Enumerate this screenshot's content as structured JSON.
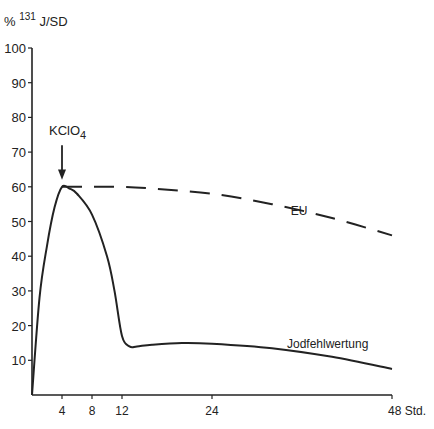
{
  "chart_data": {
    "type": "line",
    "title": "",
    "ylabel_prefix": "%",
    "ylabel_sup": "131",
    "ylabel_main": "J/SD",
    "xlabel": "Std.",
    "xlim": [
      0,
      48
    ],
    "ylim": [
      0,
      100
    ],
    "x_ticks": [
      4,
      8,
      12,
      24,
      48
    ],
    "x_tick_labels": [
      "4",
      "8",
      "12",
      "24",
      "48 Std."
    ],
    "y_ticks": [
      10,
      20,
      30,
      40,
      50,
      60,
      70,
      80,
      90,
      100
    ],
    "y_tick_labels": [
      "10",
      "20",
      "30",
      "40",
      "50",
      "60",
      "70",
      "80",
      "90",
      "100"
    ],
    "grid": false,
    "annotations": [
      {
        "text": "KClO",
        "subscript": "4",
        "x": 4,
        "y": 60,
        "arrow": true
      }
    ],
    "series": [
      {
        "name": "EU",
        "style": "dashed",
        "x": [
          0,
          1,
          2,
          3,
          4,
          8,
          12,
          16,
          24,
          32,
          40,
          48
        ],
        "y": [
          0,
          28,
          43,
          54,
          60,
          60,
          60,
          59.5,
          58,
          55,
          51,
          46
        ]
      },
      {
        "name": "Jodfehlwertung",
        "style": "solid",
        "x": [
          0,
          1,
          2,
          3,
          4,
          5,
          6,
          8,
          10,
          11,
          12,
          13,
          14,
          16,
          20,
          24,
          32,
          40,
          48
        ],
        "y": [
          0,
          28,
          43,
          54,
          60,
          59.5,
          58,
          52,
          40,
          30,
          17,
          14,
          14,
          14.5,
          15,
          14.8,
          13.5,
          11,
          7.5
        ]
      }
    ]
  }
}
